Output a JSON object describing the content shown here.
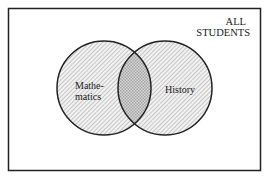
{
  "diagram": {
    "type": "venn",
    "universe_label_line1": "ALL",
    "universe_label_line2": "STUDENTS",
    "sets": [
      {
        "name": "mathematics",
        "label_line1": "Mathe-",
        "label_line2": "matics"
      },
      {
        "name": "history",
        "label": "History"
      }
    ],
    "intersection": "Mathematics and History",
    "colors": {
      "stroke": "#222222",
      "hatch": "#9a9a9a",
      "crosshatch_fill": "#cfcfcf",
      "background": "#ffffff"
    }
  }
}
